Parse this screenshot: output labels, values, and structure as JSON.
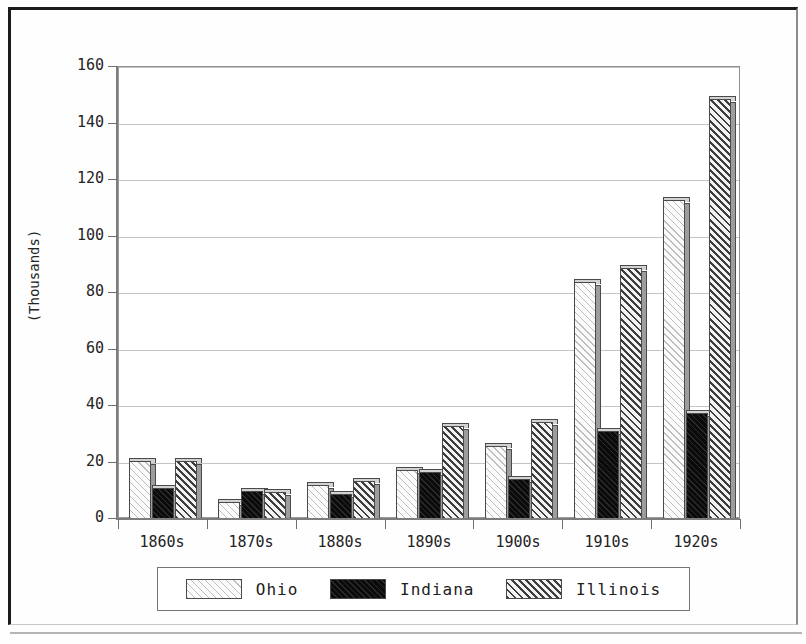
{
  "chart_data": {
    "type": "bar",
    "title": "",
    "xlabel": "",
    "ylabel": "(Thousands)",
    "categories": [
      "1860s",
      "1870s",
      "1880s",
      "1890s",
      "1900s",
      "1910s",
      "1920s"
    ],
    "series": [
      {
        "name": "Ohio",
        "color": "#fbfbfb",
        "pattern": "light-diagonal-hatch",
        "values": [
          20.5,
          6.0,
          12.0,
          17.5,
          26.0,
          84.0,
          113.0
        ]
      },
      {
        "name": "Indiana",
        "color": "#121212",
        "pattern": "solid-black",
        "values": [
          11.0,
          10.0,
          9.0,
          16.5,
          14.0,
          31.0,
          37.5
        ]
      },
      {
        "name": "Illinois",
        "color": "#3d3d3d",
        "pattern": "dark-diagonal-hatch",
        "values": [
          20.5,
          9.5,
          13.5,
          33.0,
          34.5,
          89.0,
          148.5
        ]
      }
    ],
    "ylim": [
      0,
      160
    ],
    "yticks": [
      0,
      20,
      40,
      60,
      80,
      100,
      120,
      140,
      160
    ],
    "ytick_labels": [
      "0",
      "20",
      "40",
      "60",
      "80",
      "100",
      "120",
      "140",
      "160"
    ],
    "grid": true,
    "legend_position": "bottom",
    "style": "3d-bar"
  },
  "legend": {
    "items": [
      {
        "label": "Ohio"
      },
      {
        "label": "Indiana"
      },
      {
        "label": "Illinois"
      }
    ]
  }
}
